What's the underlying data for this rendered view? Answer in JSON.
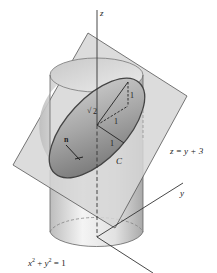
{
  "figure": {
    "labels": {
      "z_axis": "z",
      "y_axis": "y",
      "plane_equation": "z = y + 3",
      "cylinder_x": "x",
      "cylinder_exp1": "2",
      "cylinder_plus": " + ",
      "cylinder_y": "y",
      "cylinder_exp2": "2",
      "cylinder_eq_rest": " = 1",
      "curve_name": "C",
      "normal_vector": "n",
      "sqrt2_radical": "√",
      "sqrt2_value": "2",
      "segment_one_a": "1",
      "segment_one_b": "1",
      "segment_one_c": "1"
    },
    "colors": {
      "plane_fill": "#d9d9d9",
      "plane_stroke": "#555555",
      "cylinder_light": "#f2f2f2",
      "cylinder_dark": "#b5b5b5",
      "ellipse_fill_dark": "#7d7d7d",
      "ellipse_fill_light": "#bdbdbd",
      "axis_color": "#333333"
    }
  }
}
